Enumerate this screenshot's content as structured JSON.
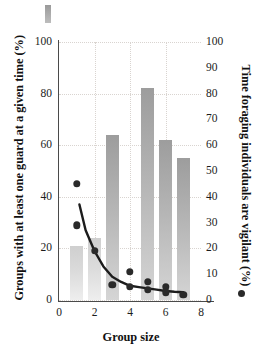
{
  "chart_data": {
    "type": "bar",
    "title": "",
    "xlabel": "Group size",
    "ylabel": "Groups with at least one guard at a given time (%)",
    "y2label": "Time foraging individuals are vigilant (%)",
    "xlim": [
      0,
      8
    ],
    "ylim": [
      0,
      100
    ],
    "y2lim": [
      0,
      100
    ],
    "xticks": [
      0,
      2,
      4,
      6,
      8
    ],
    "yticks": [
      0,
      20,
      40,
      60,
      80,
      100
    ],
    "y2ticks": [
      0,
      10,
      20,
      30,
      40,
      50,
      60,
      70,
      80,
      90,
      100
    ],
    "grid": true,
    "legend": "none",
    "categories": [
      1,
      2,
      3,
      4,
      5,
      6,
      7
    ],
    "series": [
      {
        "name": "Groups with at least one guard at a given time (%)",
        "axis": "left",
        "type": "bar",
        "values": [
          21,
          24,
          64,
          0,
          82,
          62,
          55
        ]
      },
      {
        "name": "Time foraging individuals are vigilant (%)",
        "axis": "right",
        "type": "scatter",
        "points": [
          {
            "x": 1,
            "y": 45
          },
          {
            "x": 1,
            "y": 29
          },
          {
            "x": 2,
            "y": 19
          },
          {
            "x": 3,
            "y": 6
          },
          {
            "x": 4,
            "y": 11
          },
          {
            "x": 4,
            "y": 5
          },
          {
            "x": 5,
            "y": 7
          },
          {
            "x": 5,
            "y": 4
          },
          {
            "x": 6,
            "y": 5
          },
          {
            "x": 6,
            "y": 3
          },
          {
            "x": 7,
            "y": 2
          }
        ]
      },
      {
        "name": "fitted decay curve",
        "axis": "right",
        "type": "line",
        "points": [
          {
            "x": 1.15,
            "y": 37
          },
          {
            "x": 1.5,
            "y": 27
          },
          {
            "x": 2,
            "y": 19
          },
          {
            "x": 2.5,
            "y": 13
          },
          {
            "x": 3,
            "y": 9
          },
          {
            "x": 3.5,
            "y": 7
          },
          {
            "x": 4,
            "y": 5.5
          },
          {
            "x": 4.5,
            "y": 5
          },
          {
            "x": 5,
            "y": 4.5
          },
          {
            "x": 5.5,
            "y": 4
          },
          {
            "x": 6,
            "y": 3.5
          },
          {
            "x": 6.5,
            "y": 3.2
          },
          {
            "x": 7,
            "y": 3
          }
        ]
      }
    ]
  },
  "axes": {
    "left": {
      "title": "Groups with at least one guard at a given time (%)",
      "ticks": [
        "0",
        "20",
        "40",
        "60",
        "80",
        "100"
      ]
    },
    "right": {
      "title": "Time foraging individuals are vigilant (%)",
      "ticks": [
        "0",
        "10",
        "20",
        "30",
        "40",
        "50",
        "60",
        "70",
        "80",
        "90",
        "100"
      ]
    },
    "bottom": {
      "title": "Group size",
      "ticks": [
        "0",
        "2",
        "4",
        "6",
        "8"
      ]
    }
  },
  "colors": {
    "bar_dark": "#9d9d9d",
    "bar_light": "#d5d5d5",
    "marker": "#2a2a2a",
    "curve": "#1c1c1c",
    "grid": "#d9d4d0",
    "axis": "#4a4a4a"
  }
}
